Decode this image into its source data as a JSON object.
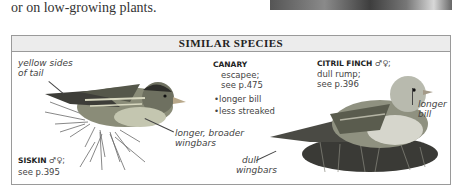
{
  "intro_text": "or on low-growing plants.",
  "box": {
    "title": "SIMILAR SPECIES"
  },
  "siskin": {
    "name": "SISKIN",
    "sex_symbols": "♂♀;",
    "ref": "see p.395",
    "labels": {
      "tail": "yellow sides of tail",
      "tail_line1": "yellow sides",
      "tail_line2": "of tail",
      "wingbars_line1": "longer, broader",
      "wingbars_line2": "wingbars"
    },
    "icon": "siskin-bird-illustration"
  },
  "canary": {
    "name": "CANARY",
    "line1": "escapee;",
    "line2": "see p.475",
    "bullets": [
      "longer bill",
      "less streaked"
    ]
  },
  "citril_finch": {
    "name": "CITRIL FINCH",
    "sex_symbols": "♂♀;",
    "line1": "dull rump;",
    "line2": "see p.396",
    "labels": {
      "bill_line1": "longer",
      "bill_line2": "bill",
      "wingbars_line1": "dull",
      "wingbars_line2": "wingbars"
    },
    "icon": "citril-finch-bird-illustration"
  }
}
